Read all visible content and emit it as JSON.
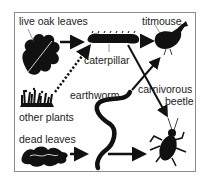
{
  "diagram": {
    "type": "food web",
    "nodes": [
      {
        "id": "live_oak_leaves",
        "label": "live oak leaves"
      },
      {
        "id": "other_plants",
        "label": "other plants"
      },
      {
        "id": "dead_leaves",
        "label": "dead leaves"
      },
      {
        "id": "caterpillar",
        "label": "caterpillar"
      },
      {
        "id": "earthworm",
        "label": "earthworm"
      },
      {
        "id": "titmouse",
        "label": "titmouse"
      },
      {
        "id": "carnivorous_beetle",
        "label": "carnivorous\nbeetle",
        "line1": "carnivorous",
        "line2": "beetle"
      }
    ],
    "edges": [
      {
        "from": "live oak leaves",
        "to": "caterpillar",
        "style": "solid"
      },
      {
        "from": "other plants",
        "to": "caterpillar",
        "style": "dotted"
      },
      {
        "from": "caterpillar",
        "to": "titmouse",
        "style": "solid"
      },
      {
        "from": "caterpillar",
        "to": "carnivorous beetle",
        "style": "solid"
      },
      {
        "from": "earthworm",
        "to": "titmouse",
        "style": "solid"
      },
      {
        "from": "dead leaves",
        "to": "earthworm",
        "style": "solid"
      },
      {
        "from": "earthworm",
        "to": "carnivorous beetle",
        "style": "solid"
      }
    ]
  },
  "labels": {
    "live_oak_leaves": "live oak leaves",
    "other_plants": "other plants",
    "dead_leaves": "dead leaves",
    "caterpillar": "caterpillar",
    "earthworm": "earthworm",
    "titmouse": "titmouse",
    "carnivorous": "carnivorous",
    "beetle": "beetle"
  }
}
